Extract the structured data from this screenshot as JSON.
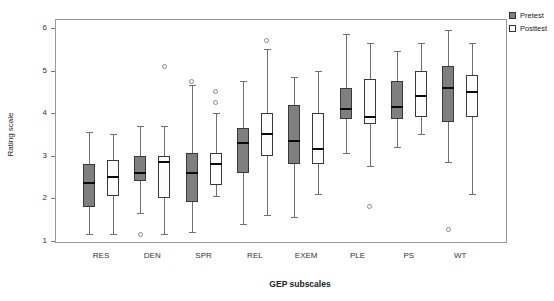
{
  "chart_data": {
    "type": "boxplot",
    "title": "",
    "xlabel": "GEP subscales",
    "ylabel": "Rating scale",
    "ylim": [
      1,
      6
    ],
    "yticks": [
      1,
      2,
      3,
      4,
      5,
      6
    ],
    "grid": false,
    "legend_position": "top-right-outside",
    "categories": [
      "RES",
      "DEN",
      "SPR",
      "REL",
      "EXEM",
      "PLE",
      "PS",
      "WT"
    ],
    "series": [
      {
        "name": "Pretest",
        "fill_color": "#7f7f7f",
        "boxes": [
          {
            "whisker_low": 1.15,
            "q1": 1.8,
            "median": 2.35,
            "q3": 2.8,
            "whisker_high": 3.55,
            "outliers": []
          },
          {
            "whisker_low": 1.65,
            "q1": 2.4,
            "median": 2.6,
            "q3": 3.0,
            "whisker_high": 3.7,
            "outliers": [
              1.15
            ]
          },
          {
            "whisker_low": 1.2,
            "q1": 1.9,
            "median": 2.6,
            "q3": 3.05,
            "whisker_high": 4.65,
            "outliers": [
              4.75
            ]
          },
          {
            "whisker_low": 1.4,
            "q1": 2.6,
            "median": 3.3,
            "q3": 3.65,
            "whisker_high": 4.75,
            "outliers": []
          },
          {
            "whisker_low": 1.55,
            "q1": 2.8,
            "median": 3.35,
            "q3": 4.2,
            "whisker_high": 4.85,
            "outliers": []
          },
          {
            "whisker_low": 3.05,
            "q1": 3.85,
            "median": 4.1,
            "q3": 4.6,
            "whisker_high": 5.85,
            "outliers": []
          },
          {
            "whisker_low": 3.2,
            "q1": 3.85,
            "median": 4.15,
            "q3": 4.75,
            "whisker_high": 5.45,
            "outliers": []
          },
          {
            "whisker_low": 2.85,
            "q1": 3.8,
            "median": 4.6,
            "q3": 5.1,
            "whisker_high": 5.95,
            "outliers": [
              1.25
            ]
          }
        ]
      },
      {
        "name": "Posttest",
        "fill_color": "#fdfdfd",
        "boxes": [
          {
            "whisker_low": 1.15,
            "q1": 2.05,
            "median": 2.5,
            "q3": 2.9,
            "whisker_high": 3.5,
            "outliers": []
          },
          {
            "whisker_low": 1.15,
            "q1": 2.0,
            "median": 2.85,
            "q3": 3.0,
            "whisker_high": 3.7,
            "outliers": [
              5.1
            ]
          },
          {
            "whisker_low": 2.05,
            "q1": 2.3,
            "median": 2.8,
            "q3": 3.05,
            "whisker_high": 4.0,
            "outliers": [
              4.5,
              4.25
            ]
          },
          {
            "whisker_low": 1.6,
            "q1": 3.0,
            "median": 3.5,
            "q3": 4.0,
            "whisker_high": 5.5,
            "outliers": [
              5.7
            ]
          },
          {
            "whisker_low": 2.1,
            "q1": 2.8,
            "median": 3.15,
            "q3": 4.0,
            "whisker_high": 5.0,
            "outliers": []
          },
          {
            "whisker_low": 2.75,
            "q1": 3.75,
            "median": 3.9,
            "q3": 4.8,
            "whisker_high": 5.65,
            "outliers": [
              1.8
            ]
          },
          {
            "whisker_low": 3.5,
            "q1": 3.9,
            "median": 4.4,
            "q3": 5.0,
            "whisker_high": 5.65,
            "outliers": []
          },
          {
            "whisker_low": 2.1,
            "q1": 3.9,
            "median": 4.5,
            "q3": 4.9,
            "whisker_high": 5.65,
            "outliers": []
          }
        ]
      }
    ]
  }
}
